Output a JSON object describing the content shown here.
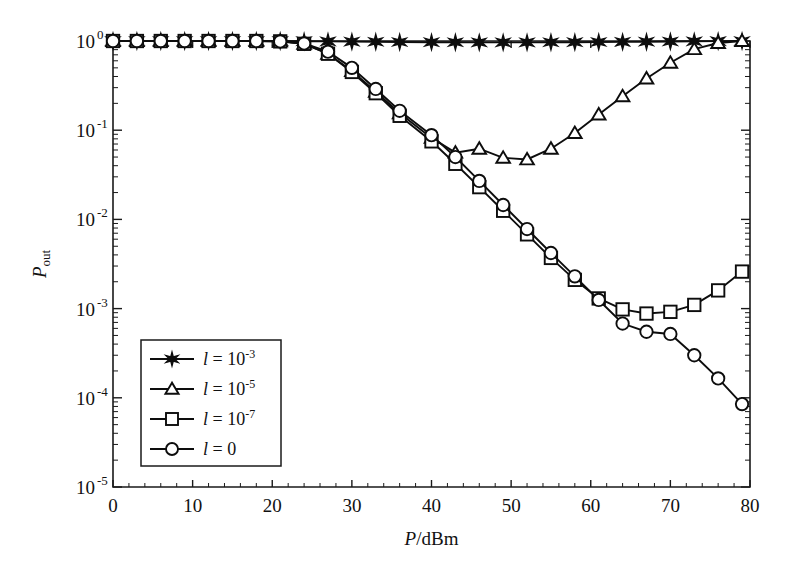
{
  "figure": {
    "background": "#ffffff",
    "ink_color": "#0d0d0d"
  },
  "axes": {
    "x": {
      "label_main": "P",
      "label_rest": "/dBm",
      "ticks": [
        "0",
        "10",
        "20",
        "30",
        "40",
        "50",
        "60",
        "70",
        "80"
      ],
      "min": 0,
      "max": 80
    },
    "y": {
      "label_main": "P",
      "label_sub": "out",
      "ticks": [
        "10",
        "10",
        "10",
        "10",
        "10",
        "10"
      ],
      "tick_exponents": [
        "0",
        "-1",
        "-2",
        "-3",
        "-4",
        "-5"
      ],
      "min_exp": -5,
      "max_exp": 0
    }
  },
  "legend": {
    "entries": [
      {
        "marker": "star",
        "label_var": "l",
        "label_eq": " = 10",
        "label_sup": "-3"
      },
      {
        "marker": "triangle",
        "label_var": "l",
        "label_eq": " = 10",
        "label_sup": "-5"
      },
      {
        "marker": "square",
        "label_var": "l",
        "label_eq": " = 10",
        "label_sup": "-7"
      },
      {
        "marker": "circle",
        "label_var": "l",
        "label_eq": " = 0",
        "label_sup": ""
      }
    ]
  },
  "chart_data": {
    "type": "line",
    "title": "",
    "xlabel": "P/dBm",
    "ylabel": "P_out",
    "xlim": [
      0,
      80
    ],
    "ylim": [
      1e-05,
      1
    ],
    "yscale": "log",
    "grid": false,
    "legend_position": "lower-left",
    "series": [
      {
        "name": "l = 10^-3",
        "marker": "star",
        "x": [
          0,
          3,
          6,
          9,
          12,
          15,
          18,
          21,
          24,
          27,
          30,
          33,
          36,
          40,
          43,
          46,
          49,
          52,
          55,
          58,
          61,
          64,
          67,
          70,
          73,
          76,
          79
        ],
        "y": [
          1.0,
          1.0,
          1.0,
          1.0,
          1.0,
          1.0,
          1.0,
          1.0,
          0.995,
          0.99,
          0.985,
          0.98,
          0.975,
          0.97,
          0.968,
          0.966,
          0.965,
          0.966,
          0.968,
          0.97,
          0.974,
          0.978,
          0.982,
          0.987,
          0.992,
          0.996,
          1.0
        ]
      },
      {
        "name": "l = 10^-5",
        "marker": "triangle",
        "x": [
          0,
          3,
          6,
          9,
          12,
          15,
          18,
          21,
          24,
          27,
          30,
          33,
          36,
          40,
          43,
          46,
          49,
          52,
          55,
          58,
          61,
          64,
          67,
          70,
          73,
          76,
          79
        ],
        "y": [
          1.0,
          1.0,
          1.0,
          1.0,
          1.0,
          1.0,
          1.0,
          0.99,
          0.93,
          0.72,
          0.46,
          0.27,
          0.155,
          0.082,
          0.056,
          0.062,
          0.049,
          0.047,
          0.062,
          0.093,
          0.15,
          0.24,
          0.38,
          0.57,
          0.81,
          0.95,
          1.0
        ]
      },
      {
        "name": "l = 10^-7",
        "marker": "square",
        "x": [
          0,
          3,
          6,
          9,
          12,
          15,
          18,
          21,
          24,
          27,
          30,
          33,
          36,
          40,
          43,
          46,
          49,
          52,
          55,
          58,
          61,
          64,
          67,
          70,
          73,
          76,
          79
        ],
        "y": [
          1.0,
          1.0,
          1.0,
          1.0,
          1.0,
          1.0,
          1.0,
          0.99,
          0.93,
          0.72,
          0.45,
          0.26,
          0.145,
          0.075,
          0.042,
          0.023,
          0.0125,
          0.0068,
          0.0037,
          0.0021,
          0.0013,
          0.00098,
          0.00088,
          0.00092,
          0.0011,
          0.0016,
          0.0026
        ]
      },
      {
        "name": "l = 0",
        "marker": "circle",
        "x": [
          0,
          3,
          6,
          9,
          12,
          15,
          18,
          21,
          24,
          27,
          30,
          33,
          36,
          40,
          43,
          46,
          49,
          52,
          55,
          58,
          61,
          64,
          67,
          70,
          73,
          76,
          79
        ],
        "y": [
          1.0,
          1.0,
          1.0,
          1.0,
          1.0,
          1.0,
          1.0,
          0.99,
          0.94,
          0.76,
          0.5,
          0.29,
          0.165,
          0.088,
          0.05,
          0.027,
          0.0145,
          0.0078,
          0.0042,
          0.0023,
          0.00125,
          0.00068,
          0.00055,
          0.00052,
          0.0003,
          0.000165,
          8.5e-05
        ]
      }
    ]
  }
}
